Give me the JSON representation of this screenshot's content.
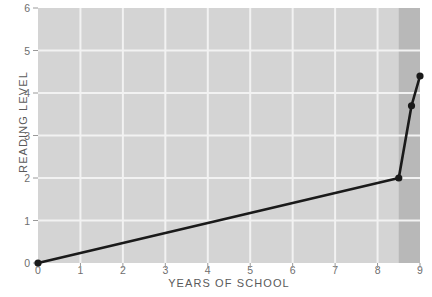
{
  "chart_data": {
    "type": "line",
    "title": "",
    "xlabel": "YEARS OF SCHOOL",
    "ylabel": "READING LEVEL",
    "xlim": [
      0,
      9
    ],
    "ylim": [
      0,
      6
    ],
    "xticks": [
      "0",
      "1",
      "2",
      "3",
      "4",
      "5",
      "6",
      "7",
      "8",
      "9"
    ],
    "yticks": [
      "0",
      "1",
      "2",
      "3",
      "4",
      "5",
      "6"
    ],
    "grid": true,
    "legend": "none",
    "series": [
      {
        "name": "reading level",
        "x": [
          0,
          8.5,
          8.8,
          9
        ],
        "values": [
          0,
          2,
          3.7,
          4.4
        ],
        "marker": "circle",
        "color": "#1a1a1a"
      }
    ],
    "shaded_region": {
      "x_start": 8.5,
      "x_end": 9,
      "color": "#b8b8b8"
    },
    "plot_background": "#d4d4d4",
    "gridline_color": "#f2f2f2"
  },
  "axes": {
    "y_title": "READING LEVEL",
    "x_title": "YEARS OF SCHOOL"
  }
}
